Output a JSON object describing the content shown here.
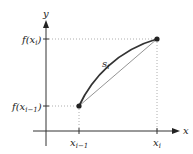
{
  "diagram": {
    "axes": {
      "x_label": "x",
      "y_label": "y"
    },
    "y_ticks": {
      "top": "f(x",
      "top_sub": "i",
      "bottom": "f(x",
      "bottom_sub": "i−1"
    },
    "x_ticks": {
      "left": "x",
      "left_sub": "i−1",
      "right": "x",
      "right_sub": "i"
    },
    "curve_label": "s",
    "curve_label_sub": "i",
    "colors": {
      "curve": "#333333",
      "chord": "#888888",
      "guide": "#999999",
      "axis": "#333333"
    }
  }
}
